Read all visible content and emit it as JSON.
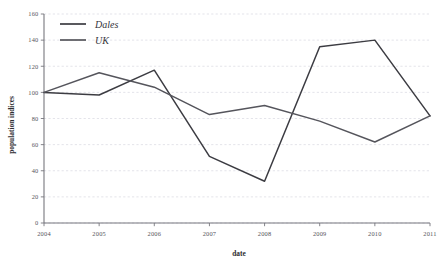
{
  "chart_data": {
    "type": "line",
    "title": "",
    "xlabel": "date",
    "ylabel": "population indices",
    "x": [
      2004,
      2005,
      2006,
      2007,
      2008,
      2009,
      2010,
      2011
    ],
    "xtick_labels": [
      "2004",
      "2005",
      "2006",
      "2007",
      "2008",
      "2009",
      "2010",
      "2011"
    ],
    "ytick_labels": [
      "0",
      "20",
      "40",
      "60",
      "80",
      "100",
      "120",
      "140",
      "160"
    ],
    "yticks": [
      0,
      20,
      40,
      60,
      80,
      100,
      120,
      140,
      160
    ],
    "ylim": [
      0,
      160
    ],
    "xlim": [
      2004,
      2011
    ],
    "grid": true,
    "grid_axis": "y",
    "legend_position": "top-left",
    "series": [
      {
        "name": "Dales",
        "color": "#3c3c42",
        "values": [
          100,
          98,
          117,
          51,
          32,
          135,
          140,
          82
        ]
      },
      {
        "name": "UK",
        "color": "#55555c",
        "values": [
          100,
          115,
          104,
          83,
          90,
          78,
          62,
          82
        ]
      }
    ]
  },
  "colors": {
    "dales": "#3c3c42",
    "uk": "#55555c",
    "grid": "#d2d2dc",
    "axis": "#77777e",
    "text": "#54545a",
    "background": "#ffffff"
  },
  "legend": {
    "entries": [
      "Dales",
      "UK"
    ]
  }
}
